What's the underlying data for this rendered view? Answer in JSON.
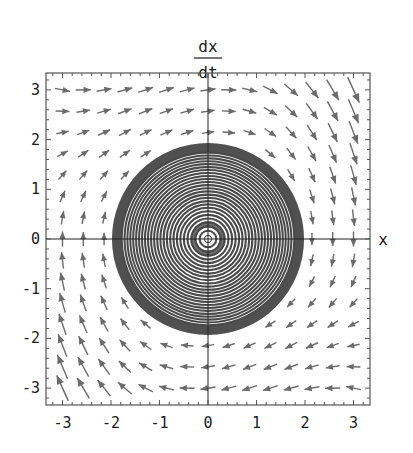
{
  "chart_data": {
    "type": "vector_field_phase_portrait",
    "title": "",
    "xlabel": "x",
    "ylabel_numerator": "dx",
    "ylabel_denominator": "dt",
    "xlim": [
      -3.35,
      3.35
    ],
    "ylim": [
      -3.35,
      3.35
    ],
    "xticks": [
      "-3",
      "-2",
      "-1",
      "0",
      "1",
      "2",
      "3"
    ],
    "yticks": [
      "-3",
      "-2",
      "-1",
      "0",
      "1",
      "2",
      "3"
    ],
    "grid": false,
    "system": "van der Pol oscillator: dx/dt = v, dv/dt = -x + mu*(1 - x^2)*v",
    "mu": 0.15,
    "vector_grid": {
      "min": -3,
      "max": 3,
      "count": 15
    },
    "limit_cycle_radius": 2.0,
    "spiral": {
      "inner_radius": 0.06,
      "outer_radius": 1.98,
      "dense_band_start": 1.78,
      "rings": 26
    },
    "colors": {
      "arrows": "#6b6b6b",
      "spiral": "#4a4a4a",
      "band": "#505050",
      "axes": "#222222",
      "frame": "#555555"
    }
  }
}
